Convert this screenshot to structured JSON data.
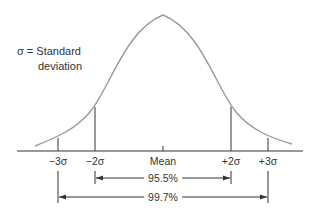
{
  "legend": {
    "line1": "σ = Standard",
    "line2": "deviation"
  },
  "axis": {
    "ticks": [
      {
        "label": "−3σ",
        "x": 58
      },
      {
        "label": "−2σ",
        "x": 95
      },
      {
        "label": "Mean",
        "x": 163
      },
      {
        "label": "+2σ",
        "x": 230
      },
      {
        "label": "+3σ",
        "x": 267
      }
    ]
  },
  "ranges": [
    {
      "label": "95.5%",
      "from": "−2σ",
      "to": "+2σ"
    },
    {
      "label": "99.7%",
      "from": "−3σ",
      "to": "+3σ"
    }
  ],
  "colors": {
    "curve": "#9a9a9a",
    "lines": "#333333"
  }
}
